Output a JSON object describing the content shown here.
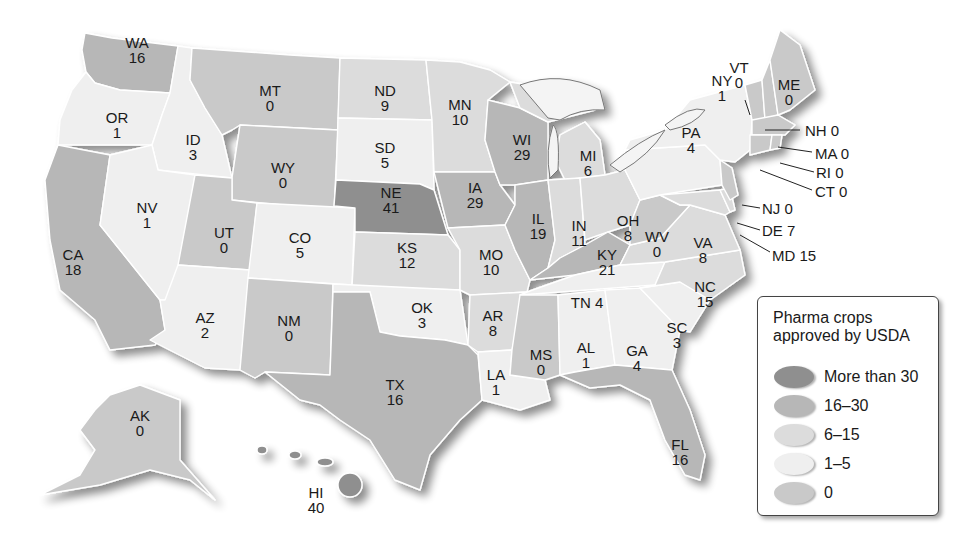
{
  "legend": {
    "title_line1": "Pharma crops",
    "title_line2": "approved by USDA",
    "items": [
      {
        "label": "More than 30",
        "color": "#8f8f8f"
      },
      {
        "label": "16–30",
        "color": "#b7b7b7"
      },
      {
        "label": "6–15",
        "color": "#dcdcdc"
      },
      {
        "label": "1–5",
        "color": "#efefef"
      },
      {
        "label": "0",
        "color": "#c9c9c9"
      }
    ]
  },
  "states": {
    "WA": {
      "abbr": "WA",
      "value": "16"
    },
    "OR": {
      "abbr": "OR",
      "value": "1"
    },
    "CA": {
      "abbr": "CA",
      "value": "18"
    },
    "ID": {
      "abbr": "ID",
      "value": "3"
    },
    "NV": {
      "abbr": "NV",
      "value": "1"
    },
    "MT": {
      "abbr": "MT",
      "value": "0"
    },
    "WY": {
      "abbr": "WY",
      "value": "0"
    },
    "UT": {
      "abbr": "UT",
      "value": "0"
    },
    "AZ": {
      "abbr": "AZ",
      "value": "2"
    },
    "CO": {
      "abbr": "CO",
      "value": "5"
    },
    "NM": {
      "abbr": "NM",
      "value": "0"
    },
    "ND": {
      "abbr": "ND",
      "value": "9"
    },
    "SD": {
      "abbr": "SD",
      "value": "5"
    },
    "NE": {
      "abbr": "NE",
      "value": "41"
    },
    "KS": {
      "abbr": "KS",
      "value": "12"
    },
    "OK": {
      "abbr": "OK",
      "value": "3"
    },
    "TX": {
      "abbr": "TX",
      "value": "16"
    },
    "MN": {
      "abbr": "MN",
      "value": "10"
    },
    "IA": {
      "abbr": "IA",
      "value": "29"
    },
    "MO": {
      "abbr": "MO",
      "value": "10"
    },
    "AR": {
      "abbr": "AR",
      "value": "8"
    },
    "LA": {
      "abbr": "LA",
      "value": "1"
    },
    "WI": {
      "abbr": "WI",
      "value": "29"
    },
    "IL": {
      "abbr": "IL",
      "value": "19"
    },
    "MI": {
      "abbr": "MI",
      "value": "6"
    },
    "IN": {
      "abbr": "IN",
      "value": "11"
    },
    "OH": {
      "abbr": "OH",
      "value": "8"
    },
    "KY": {
      "abbr": "KY",
      "value": "21"
    },
    "TN": {
      "abbr": "TN",
      "value": "4"
    },
    "MS": {
      "abbr": "MS",
      "value": "0"
    },
    "AL": {
      "abbr": "AL",
      "value": "1"
    },
    "GA": {
      "abbr": "GA",
      "value": "4"
    },
    "FL": {
      "abbr": "FL",
      "value": "16"
    },
    "SC": {
      "abbr": "SC",
      "value": "3"
    },
    "NC": {
      "abbr": "NC",
      "value": "15"
    },
    "VA": {
      "abbr": "VA",
      "value": "8"
    },
    "WV": {
      "abbr": "WV",
      "value": "0"
    },
    "PA": {
      "abbr": "PA",
      "value": "4"
    },
    "NY": {
      "abbr": "NY",
      "value": "1"
    },
    "VT": {
      "abbr": "VT",
      "value": "0"
    },
    "ME": {
      "abbr": "ME",
      "value": "0"
    },
    "NH": {
      "abbr": "NH",
      "value": "0",
      "text": "NH 0"
    },
    "MA": {
      "abbr": "MA",
      "value": "0",
      "text": "MA 0"
    },
    "RI": {
      "abbr": "RI",
      "value": "0",
      "text": "RI 0"
    },
    "CT": {
      "abbr": "CT",
      "value": "0",
      "text": "CT 0"
    },
    "NJ": {
      "abbr": "NJ",
      "value": "0",
      "text": "NJ 0"
    },
    "DE": {
      "abbr": "DE",
      "value": "7",
      "text": "DE 7"
    },
    "MD": {
      "abbr": "MD",
      "value": "15",
      "text": "MD 15"
    },
    "TN_text": "TN 4",
    "AK": {
      "abbr": "AK",
      "value": "0"
    },
    "HI": {
      "abbr": "HI",
      "value": "40"
    }
  }
}
